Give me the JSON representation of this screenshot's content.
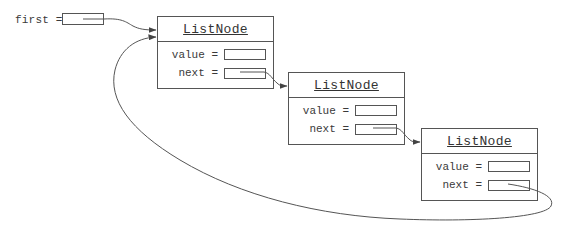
{
  "diagram": {
    "reference": {
      "label": "first ="
    },
    "node_class_name": "ListNode",
    "nodes": [
      {
        "title": "ListNode",
        "fields": [
          {
            "label": "value =",
            "value": ""
          },
          {
            "label": "next =",
            "value": "→ ListNode #2"
          }
        ]
      },
      {
        "title": "ListNode",
        "fields": [
          {
            "label": "value =",
            "value": ""
          },
          {
            "label": "next =",
            "value": "→ ListNode #3"
          }
        ]
      },
      {
        "title": "ListNode",
        "fields": [
          {
            "label": "value =",
            "value": ""
          },
          {
            "label": "next =",
            "value": "→ ListNode #1"
          }
        ]
      }
    ],
    "edges": [
      {
        "from": "first",
        "to": "node-1"
      },
      {
        "from": "node-1.next",
        "to": "node-2"
      },
      {
        "from": "node-2.next",
        "to": "node-3"
      },
      {
        "from": "node-3.next",
        "to": "node-1"
      }
    ],
    "colors": {
      "line": "#555555",
      "text": "#333333",
      "background": "#ffffff"
    }
  }
}
